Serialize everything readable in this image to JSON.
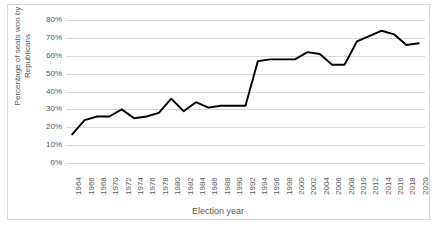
{
  "chart_data": {
    "type": "line",
    "title": "",
    "xlabel": "Election year",
    "ylabel": "Percentage of seats won by Republicans",
    "ylabel_line1": "Percentage of seats won by",
    "ylabel_line2": "Republicans",
    "ylim": [
      0,
      80
    ],
    "ytick_step": 10,
    "ytick_labels": [
      "80%",
      "70%",
      "60%",
      "50%",
      "40%",
      "30%",
      "20%",
      "10%",
      "0%"
    ],
    "ytick_values": [
      80,
      70,
      60,
      50,
      40,
      30,
      20,
      10,
      0
    ],
    "grid": true,
    "legend": "none",
    "line_color": "#000000",
    "grid_color": "#d9d9d9",
    "text_color": "#595959",
    "categories": [
      "1964",
      "1966",
      "1968",
      "1970",
      "1972",
      "1974",
      "1976",
      "1978",
      "1980",
      "1982",
      "1984",
      "1986",
      "1988",
      "1990",
      "1992",
      "1994",
      "1996",
      "1998",
      "2000",
      "2002",
      "2004",
      "2006",
      "2008",
      "2010",
      "2012",
      "2014",
      "2016",
      "2018",
      "2020"
    ],
    "values": [
      16,
      24,
      26,
      26,
      30,
      25,
      26,
      28,
      36,
      29,
      34,
      31,
      32,
      32,
      32,
      57,
      58,
      58,
      58,
      62,
      61,
      55,
      55,
      68,
      71,
      74,
      72,
      66,
      67
    ],
    "series": [
      {
        "name": "Percentage of seats won by Republicans",
        "values": [
          16,
          24,
          26,
          26,
          30,
          25,
          26,
          28,
          36,
          29,
          34,
          31,
          32,
          32,
          32,
          57,
          58,
          58,
          58,
          62,
          61,
          55,
          55,
          68,
          71,
          74,
          72,
          66,
          67
        ]
      }
    ]
  }
}
